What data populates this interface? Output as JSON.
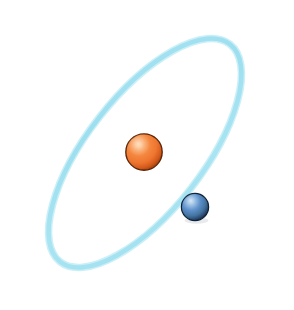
{
  "figure": {
    "name": "atom-orbit-diagram",
    "title": "Atom with single electron orbiting nucleus",
    "width": 294,
    "height": 310,
    "background_color": "#FFFFFF"
  },
  "chart_data": {
    "type": "scatter",
    "title": "Atom with single electron orbiting nucleus",
    "subtitle": "",
    "xlabel": "",
    "ylabel": "",
    "grid": false,
    "legend": "none",
    "xlim": [
      0,
      294
    ],
    "ylim": [
      0,
      310
    ],
    "annotations": [],
    "tick_labels": [],
    "series": [
      {
        "name": "nucleus",
        "values": [
          {
            "x": 144,
            "y": 152,
            "r": 18,
            "color": "#F07838",
            "label": ""
          }
        ]
      },
      {
        "name": "electron",
        "values": [
          {
            "x": 195,
            "y": 207,
            "r": 13.5,
            "color": "#4F86C6",
            "label": ""
          }
        ]
      }
    ],
    "paths": [
      {
        "name": "orbit-ellipse",
        "shape": "ellipse",
        "cx": 145,
        "cy": 153,
        "rx": 138,
        "ry": 58,
        "rotation_deg": -52,
        "stroke": "#A5E2F0",
        "stroke_width": 5,
        "fill": "none"
      }
    ]
  },
  "orbit": {
    "name": "electron-orbit-path",
    "center_x": 145,
    "center_y": 153,
    "radius_x": 138,
    "radius_y": 58,
    "rotation_deg": -52,
    "stroke_color": "#A5E2F0",
    "stroke_highlight_color": "#CFF0F8",
    "stroke_width": 5
  },
  "nucleus": {
    "name": "nucleus-sphere",
    "center_x": 144,
    "center_y": 152,
    "radius": 18,
    "base_color": "#EE7733",
    "highlight_color": "#FCC79A",
    "mid_color": "#F2803A",
    "shadow_color": "#9E4516",
    "rim_color": "#5E2606",
    "highlight_offset_x": -6,
    "highlight_offset_y": -7
  },
  "electron": {
    "name": "electron-sphere",
    "center_x": 195,
    "center_y": 207,
    "radius": 13.5,
    "base_color": "#4E84C4",
    "highlight_color": "#A9C9E8",
    "mid_color": "#4B80C0",
    "shadow_color": "#1E3B63",
    "rim_color": "#10253F",
    "highlight_offset_x": -4,
    "highlight_offset_y": -5
  }
}
